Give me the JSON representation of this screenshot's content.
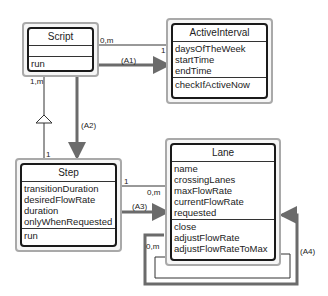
{
  "diagram": {
    "type": "UML class diagram",
    "classes": {
      "script": {
        "name": "Script",
        "attributes": [],
        "operations": [
          "run"
        ]
      },
      "active_interval": {
        "name": "ActiveInterval",
        "attributes": [
          "daysOfTheWeek",
          "startTime",
          "endTime"
        ],
        "operations": [
          "checkIfActiveNow"
        ]
      },
      "step": {
        "name": "Step",
        "attributes": [
          "transitionDuration",
          "desiredFlowRate",
          "duration",
          "onlyWhenRequested"
        ],
        "operations": [
          "run"
        ]
      },
      "lane": {
        "name": "Lane",
        "attributes": [
          "name",
          "crossingLanes",
          "maxFlowRate",
          "currentFlowRate",
          "requested"
        ],
        "operations": [
          "close",
          "adjustFlowRate",
          "adjustFlowRateToMax"
        ]
      }
    },
    "associations": {
      "script_active": {
        "from_mult": "0,m",
        "to_mult": "1",
        "label": "(A1)"
      },
      "script_step": {
        "from_mult": "1,m",
        "to_mult": "1",
        "label": "(A2)"
      },
      "step_lane": {
        "from_mult": "1",
        "to_mult": "0,m",
        "label": "(A3)"
      },
      "lane_self": {
        "mult": "0,m",
        "label": "(A4)"
      }
    },
    "colors": {
      "box_border": "#1a1a1a",
      "outer_border": "#a9a9a9",
      "arrow": "#6b6b6b",
      "line": "#333333"
    }
  }
}
